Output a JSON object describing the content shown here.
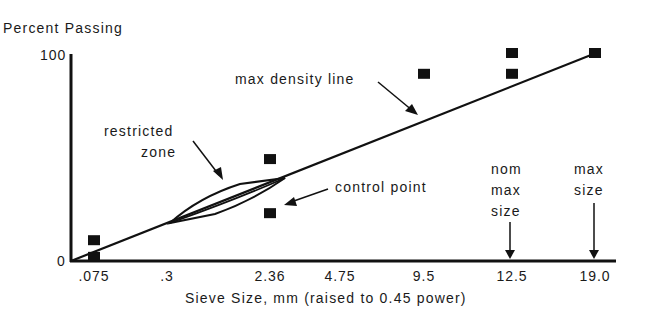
{
  "chart_data": {
    "type": "scatter",
    "title": "",
    "ylabel": "Percent Passing",
    "xlabel": "Sieve Size, mm (raised to 0.45 power)",
    "x_scale": "power 0.45",
    "ylim": [
      0,
      100
    ],
    "y_ticks": [
      "0",
      "100"
    ],
    "x_ticks": [
      ".075",
      ".3",
      "2.36",
      "4.75",
      "9.5",
      "12.5",
      "19.0"
    ],
    "x_tick_values": [
      0.075,
      0.3,
      2.36,
      4.75,
      9.5,
      12.5,
      19.0
    ],
    "max_density_line": {
      "from": [
        0,
        0
      ],
      "to": [
        19.0,
        100
      ]
    },
    "restricted_zone": {
      "x_range": [
        0.3,
        2.36
      ],
      "description": "lens-shaped zone around max density line"
    },
    "control_points": [
      {
        "x": 0.075,
        "y": 2
      },
      {
        "x": 0.075,
        "y": 10
      },
      {
        "x": 2.36,
        "y": 23
      },
      {
        "x": 2.36,
        "y": 49
      },
      {
        "x": 9.5,
        "y": 90
      },
      {
        "x": 12.5,
        "y": 90
      },
      {
        "x": 12.5,
        "y": 100
      },
      {
        "x": 19.0,
        "y": 100
      }
    ],
    "annotations": [
      {
        "text": "max density line"
      },
      {
        "text": "restricted zone"
      },
      {
        "text": "control point"
      },
      {
        "text": "nom max size",
        "x": 12.5
      },
      {
        "text": "max size",
        "x": 19.0
      }
    ],
    "grid": false,
    "legend": "none"
  },
  "labels": {
    "y_axis_title": "Percent Passing",
    "x_axis_title": "Sieve Size, mm (raised to 0.45 power)",
    "max_density": "max density line",
    "restricted_1": "restricted",
    "restricted_2": "zone",
    "control_point": "control point",
    "nom_1": "nom",
    "nom_2": "max",
    "nom_3": "size",
    "max_1": "max",
    "max_2": "size"
  }
}
